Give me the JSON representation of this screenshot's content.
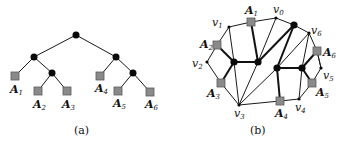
{
  "figure": {
    "panel_a": {
      "caption": "(a)",
      "leaves": [
        {
          "name": "A",
          "sub": "1"
        },
        {
          "name": "A",
          "sub": "2"
        },
        {
          "name": "A",
          "sub": "3"
        },
        {
          "name": "A",
          "sub": "4"
        },
        {
          "name": "A",
          "sub": "5"
        },
        {
          "name": "A",
          "sub": "6"
        }
      ]
    },
    "panel_b": {
      "caption": "(b)",
      "leaves": [
        {
          "name": "A",
          "sub": "1"
        },
        {
          "name": "A",
          "sub": "2"
        },
        {
          "name": "A",
          "sub": "3"
        },
        {
          "name": "A",
          "sub": "4"
        },
        {
          "name": "A",
          "sub": "5"
        },
        {
          "name": "A",
          "sub": "6"
        }
      ],
      "vertices": [
        {
          "name": "v",
          "sub": "0"
        },
        {
          "name": "v",
          "sub": "1"
        },
        {
          "name": "v",
          "sub": "2"
        },
        {
          "name": "v",
          "sub": "3"
        },
        {
          "name": "v",
          "sub": "4"
        },
        {
          "name": "v",
          "sub": "5"
        },
        {
          "name": "v",
          "sub": "6"
        }
      ]
    },
    "colors": {
      "leaf_fill": "#8a8a8a",
      "node_fill": "#0a0a0a",
      "edge": "#1a1a1a"
    }
  }
}
